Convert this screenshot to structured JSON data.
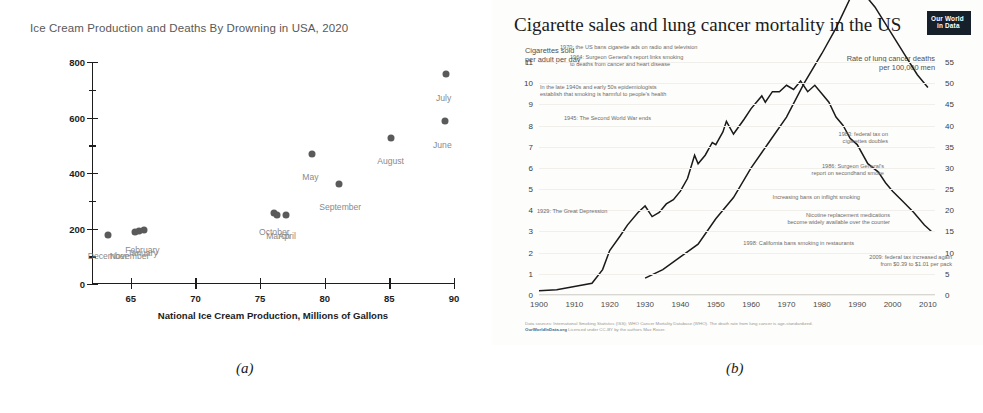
{
  "panel_a": {
    "title": "Ice Cream Production and Deaths By Drowning in USA, 2020",
    "caption": "(a)",
    "chart_data": {
      "type": "scatter",
      "title": "Ice Cream Production and Deaths By Drowning in USA, 2020",
      "xlabel": "National Ice Cream Production, Millions of Gallons",
      "ylabel": "Deaths by Accidental Drowning Nationally",
      "xlim": [
        62,
        90
      ],
      "ylim": [
        0,
        800
      ],
      "xticks": [
        "65",
        "70",
        "75",
        "80",
        "85",
        "90"
      ],
      "xtick_values": [
        65,
        70,
        75,
        80,
        85,
        90
      ],
      "yticks": [
        "0",
        "200",
        "400",
        "600",
        "800"
      ],
      "ytick_values": [
        0,
        200,
        400,
        600,
        800
      ],
      "yminor_values": [
        100,
        300,
        500,
        700
      ],
      "grid": false,
      "legend": "none",
      "points": [
        {
          "label": "December",
          "x": 63.2,
          "y": 175
        },
        {
          "label": "November",
          "x": 65.3,
          "y": 186
        },
        {
          "label": "January",
          "x": 65.6,
          "y": 190
        },
        {
          "label": "February",
          "x": 66.0,
          "y": 196
        },
        {
          "label": "October",
          "x": 76.1,
          "y": 255
        },
        {
          "label": "March",
          "x": 76.3,
          "y": 247
        },
        {
          "label": "April",
          "x": 77.0,
          "y": 248
        },
        {
          "label": "May",
          "x": 79.0,
          "y": 470
        },
        {
          "label": "September",
          "x": 81.1,
          "y": 360
        },
        {
          "label": "August",
          "x": 85.1,
          "y": 525
        },
        {
          "label": "June",
          "x": 89.3,
          "y": 588
        },
        {
          "label": "July",
          "x": 89.4,
          "y": 758
        }
      ],
      "point_labels": [
        {
          "text": "December",
          "x": 63.2,
          "y": 118
        },
        {
          "text": "November",
          "x": 64.9,
          "y": 120
        },
        {
          "text": "January",
          "x": 65.9,
          "y": 128
        },
        {
          "text": "February",
          "x": 65.9,
          "y": 140
        },
        {
          "text": "October",
          "x": 76.1,
          "y": 205
        },
        {
          "text": "March",
          "x": 76.4,
          "y": 192
        },
        {
          "text": "April",
          "x": 77.1,
          "y": 192
        },
        {
          "text": "May",
          "x": 78.9,
          "y": 405
        },
        {
          "text": "September",
          "x": 81.2,
          "y": 297
        },
        {
          "text": "August",
          "x": 85.1,
          "y": 462
        },
        {
          "text": "June",
          "x": 89.1,
          "y": 520
        },
        {
          "text": "July",
          "x": 89.2,
          "y": 690
        }
      ]
    }
  },
  "panel_b": {
    "title": "Cigarette sales and lung cancer mortality in the US",
    "caption": "(b)",
    "logo": {
      "line1": "Our World",
      "line2": "in Data"
    },
    "left_caption": "Cigarettes sold\nper adult per day",
    "right_caption": "Rate of lung cancer deaths\nper 100,000 men",
    "footer_sources": "Data sources: International Smoking Statistics (ISS); WHO Cancer Mortality Database (WHO). The death rate from lung cancer is age-standardized.",
    "footer_brand": "OurWorldInData.org",
    "footer_licence": "Licenced under CC-BY by the authors Max Roser.",
    "chart_data": {
      "type": "line",
      "title": "Cigarette sales and lung cancer mortality in the US",
      "xlabel": "",
      "ylabel_left": "Cigarettes sold per adult per day",
      "ylabel_right": "Rate of lung cancer deaths per 100,000 men",
      "xlim": [
        1900,
        2012
      ],
      "xticks": [
        "1900",
        "1910",
        "1920",
        "1930",
        "1940",
        "1950",
        "1960",
        "1970",
        "1980",
        "1990",
        "2000",
        "2010"
      ],
      "xtick_values": [
        1900,
        1910,
        1920,
        1930,
        1940,
        1950,
        1960,
        1970,
        1980,
        1990,
        2000,
        2010
      ],
      "left_axis": {
        "ticks": [
          "0",
          "1",
          "2",
          "3",
          "4",
          "5",
          "6",
          "7",
          "8",
          "9",
          "10",
          "11"
        ],
        "values": [
          0,
          1,
          2,
          3,
          4,
          5,
          6,
          7,
          8,
          9,
          10,
          11
        ],
        "ylim": [
          0,
          11
        ]
      },
      "right_axis": {
        "ticks": [
          "0",
          "5",
          "10",
          "15",
          "20",
          "25",
          "30",
          "35",
          "40",
          "45",
          "50",
          "55"
        ],
        "values": [
          0,
          5,
          10,
          15,
          20,
          25,
          30,
          35,
          40,
          45,
          50,
          55
        ],
        "ylim": [
          0,
          55
        ]
      },
      "grid": true,
      "legend": "none",
      "series": [
        {
          "name": "Cigarettes sold per adult per day",
          "axis": "left",
          "x": [
            1900,
            1905,
            1910,
            1915,
            1918,
            1920,
            1923,
            1925,
            1928,
            1930,
            1932,
            1934,
            1936,
            1938,
            1940,
            1942,
            1944,
            1945,
            1947,
            1949,
            1950,
            1952,
            1953,
            1955,
            1958,
            1960,
            1963,
            1964,
            1966,
            1968,
            1970,
            1972,
            1974,
            1976,
            1978,
            1980,
            1982,
            1984,
            1986,
            1988,
            1990,
            1993,
            1996,
            1998,
            2000,
            2003,
            2006,
            2009,
            2011
          ],
          "y": [
            0.2,
            0.25,
            0.4,
            0.55,
            1.2,
            2.1,
            2.8,
            3.3,
            3.9,
            4.2,
            3.7,
            3.9,
            4.3,
            4.5,
            4.9,
            5.5,
            6.6,
            6.2,
            6.6,
            7.2,
            7.1,
            7.7,
            8.2,
            7.6,
            8.3,
            8.8,
            9.4,
            9.1,
            9.6,
            9.6,
            9.9,
            9.7,
            10.1,
            9.6,
            9.9,
            9.5,
            9.1,
            8.4,
            8.0,
            7.4,
            7.1,
            6.2,
            5.8,
            5.3,
            4.9,
            4.4,
            3.9,
            3.3,
            3.0
          ]
        },
        {
          "name": "Rate of lung cancer deaths per 100,000 men",
          "axis": "right",
          "x": [
            1930,
            1935,
            1940,
            1945,
            1950,
            1955,
            1960,
            1965,
            1970,
            1975,
            1980,
            1984,
            1988,
            1990,
            1992,
            1995,
            1998,
            2001,
            2004,
            2007,
            2010
          ],
          "y": [
            4,
            6,
            9,
            12,
            18,
            23,
            30,
            36,
            42,
            50,
            57,
            63,
            70,
            72,
            71,
            68,
            64,
            60,
            56,
            52,
            49
          ]
        }
      ],
      "annotations": [
        {
          "text": "1970: the US bans cigarette ads on radio and television",
          "year": 1970
        },
        {
          "text": "1964: Surgeon General's report links smoking\nto deaths from cancer and heart disease",
          "year": 1964
        },
        {
          "text": "In the late 1940s and early 50s epidemiologists\nestablish that smoking is harmful to people's health",
          "year": 1950
        },
        {
          "text": "1945: The Second World War ends",
          "year": 1945
        },
        {
          "text": "1929: The Great Depression",
          "year": 1929
        },
        {
          "text": "1983: federal tax on\ncigarettes doubles",
          "year": 1983
        },
        {
          "text": "1986: Surgeon General's\nreport on secondhand smoke",
          "year": 1986
        },
        {
          "text": "Increasing bans on inflight smoking",
          "year": 1990
        },
        {
          "text": "Nicotine replacement medications\nbecome widely available over the counter",
          "year": 1996
        },
        {
          "text": "1998: California bans smoking in restaurants",
          "year": 1998
        },
        {
          "text": "2009: federal tax increased again\nfrom $0.39 to $1.01 per pack",
          "year": 2009
        }
      ]
    }
  }
}
